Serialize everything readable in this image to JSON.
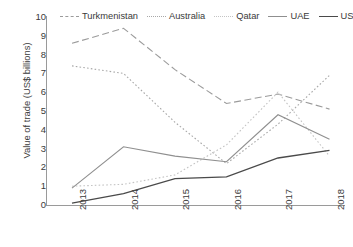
{
  "chart_data": {
    "type": "line",
    "title": "",
    "xlabel": "",
    "ylabel": "Value of trade (US$ billions)",
    "categories": [
      "2013",
      "2014",
      "2015",
      "2016",
      "2017",
      "2018"
    ],
    "ylim": [
      0,
      10
    ],
    "yticks": [
      "0",
      "1",
      "2",
      "3",
      "4",
      "5",
      "6",
      "7",
      "8",
      "9",
      "10"
    ],
    "grid": false,
    "legend_position": "top",
    "series": [
      {
        "name": "Turkmenistan",
        "color": "#9b9b9b",
        "style": "dashed",
        "values": [
          8.6,
          9.4,
          7.2,
          5.4,
          5.9,
          5.1
        ]
      },
      {
        "name": "Australia",
        "color": "#a8a8a8",
        "style": "dotted",
        "values": [
          7.4,
          7.0,
          4.4,
          2.2,
          4.3,
          6.9
        ]
      },
      {
        "name": "Qatar",
        "color": "#c4c4c4",
        "style": "dotted",
        "values": [
          1.0,
          1.1,
          1.6,
          3.2,
          6.0,
          2.6
        ]
      },
      {
        "name": "UAE",
        "color": "#8f8f8f",
        "style": "solid",
        "values": [
          0.9,
          3.1,
          2.6,
          2.3,
          4.8,
          3.5
        ]
      },
      {
        "name": "US",
        "color": "#4a4a4a",
        "style": "solid",
        "values": [
          0.1,
          0.6,
          1.4,
          1.5,
          2.5,
          2.9
        ]
      }
    ]
  }
}
